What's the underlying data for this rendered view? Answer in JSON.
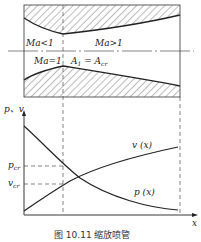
{
  "figure": {
    "caption": "图 10.11  缩放喷管",
    "nozzle": {
      "left_region_label": "Ma<1",
      "right_region_label": "Ma>1",
      "throat_label": "Ma=1",
      "throat_area_label": "A",
      "throat_area_sub": "1",
      "throat_area_eq": " = A",
      "throat_area_eq_sub": "cr"
    },
    "plot": {
      "y_axis_label": "p、v",
      "x_axis_label": "x",
      "p_cr_label": "p",
      "p_cr_sub": "cr",
      "v_cr_label": "v",
      "v_cr_sub": "cr",
      "v_curve_label": "v (x)",
      "p_curve_label": "p (x)"
    },
    "colors": {
      "line": "#222222",
      "hatch": "#555555",
      "background": "#ffffff"
    }
  }
}
